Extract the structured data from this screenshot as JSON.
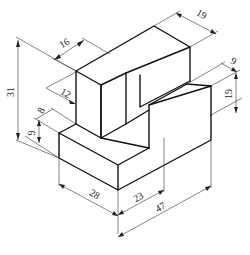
{
  "figure": {
    "title": "",
    "type": "isometric-part-drawing"
  },
  "dimensions": {
    "overall_height": "31",
    "top_block_depth": "16",
    "upper_step_height": "12",
    "base_step_depth": "8",
    "base_height": "9",
    "front_left_width": "28",
    "front_middle_width": "23",
    "overall_width": "47",
    "top_right_depth": "19",
    "right_step_depth": "9",
    "right_height": "19"
  },
  "colors": {
    "line": "#111111",
    "dimension": "#333333",
    "background": "#ffffff"
  }
}
